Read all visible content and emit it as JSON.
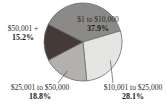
{
  "chart_data": {
    "type": "pie",
    "title": "",
    "slices": [
      {
        "label": "$1 to $10,000",
        "value": 37.9,
        "value_label": "37.9%",
        "color": "#8c8a88"
      },
      {
        "label": "$10,001 to $25,000",
        "value": 28.1,
        "value_label": "28.1%",
        "color": "#e4e4e2"
      },
      {
        "label": "$25,001 to $50,000",
        "value": 18.8,
        "value_label": "18.8%",
        "color": "#b2b1af"
      },
      {
        "label": "$50,001 +",
        "value": 15.2,
        "value_label": "15.2%",
        "color": "#453a38"
      }
    ],
    "start_angle_deg": -63,
    "direction": "clockwise",
    "legend": "none",
    "labels": "outside-with-leaders"
  }
}
